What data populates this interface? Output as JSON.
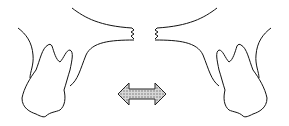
{
  "diagram": {
    "elements": [
      {
        "name": "left-tooth",
        "side": "left"
      },
      {
        "name": "right-tooth",
        "side": "right"
      },
      {
        "name": "double-arrow",
        "style": "hatched gray"
      }
    ],
    "colors": {
      "line": "#111111",
      "arrow_fill": "#bdbdbd",
      "background": "#ffffff"
    }
  }
}
